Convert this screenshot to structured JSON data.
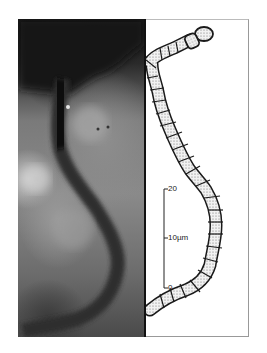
{
  "figure": {
    "left_panel": "photomicrograph-filament",
    "right_panel": "drawing-filament-chain",
    "scale_bar": {
      "top_label": "20",
      "mid_label": "10µm",
      "bottom_label": "0"
    },
    "colors": {
      "background": "#ffffff",
      "divider": "#111111",
      "outline": "#1a1a1a",
      "cell_fill": "#e8e8e8"
    }
  }
}
